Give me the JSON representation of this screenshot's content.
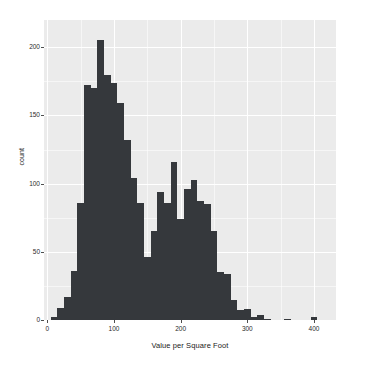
{
  "chart_data": {
    "type": "bar",
    "subtype": "histogram",
    "title": "",
    "subtitle": "",
    "xlabel": "Value per Square Foot",
    "ylabel": "count",
    "xlim": [
      -5,
      433
    ],
    "ylim": [
      0,
      220
    ],
    "xticks": [
      0,
      100,
      200,
      300,
      400
    ],
    "xtick_labels": [
      "0",
      "100",
      "200",
      "300",
      "400"
    ],
    "yticks": [
      0,
      50,
      100,
      150,
      200
    ],
    "ytick_labels": [
      "0",
      "50",
      "100",
      "150",
      "200"
    ],
    "grid": true,
    "legend": "none",
    "bin_width": 10,
    "bar_color": "#35383c",
    "panel_color": "#ebebeb",
    "grid_color": "#ffffff",
    "bin_starts": [
      5,
      15,
      25,
      35,
      45,
      55,
      65,
      75,
      85,
      95,
      105,
      115,
      125,
      135,
      145,
      155,
      165,
      175,
      185,
      195,
      205,
      215,
      225,
      235,
      245,
      255,
      265,
      275,
      285,
      295,
      305,
      315,
      325,
      335,
      345,
      355,
      365,
      375,
      385,
      395
    ],
    "values": [
      2,
      9,
      17,
      36,
      86,
      172,
      170,
      205,
      180,
      174,
      159,
      132,
      104,
      86,
      46,
      65,
      94,
      86,
      116,
      74,
      96,
      103,
      87,
      85,
      65,
      35,
      34,
      15,
      7,
      8,
      2,
      4,
      1,
      0,
      0,
      1,
      0,
      0,
      0,
      2
    ]
  }
}
